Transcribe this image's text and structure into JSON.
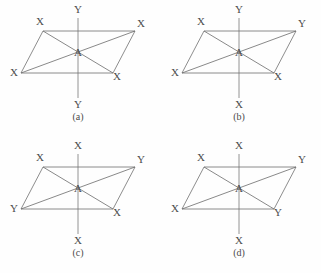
{
  "figure": {
    "background_color": "#fefefe",
    "line_color": "#6b6b6b",
    "text_color": "#4c4c4c"
  },
  "panels": [
    {
      "id": "a",
      "caption": "(a)",
      "center_label": "A",
      "labels": {
        "axial_top": "Y",
        "axial_bottom": "Y",
        "top_left": "X",
        "top_right": "X",
        "bottom_left": "X",
        "bottom_right": "X"
      }
    },
    {
      "id": "b",
      "caption": "(b)",
      "center_label": "A",
      "labels": {
        "axial_top": "Y",
        "axial_bottom": "X",
        "top_left": "X",
        "top_right": "Y",
        "bottom_left": "X",
        "bottom_right": "X"
      }
    },
    {
      "id": "c",
      "caption": "(c)",
      "center_label": "A",
      "labels": {
        "axial_top": "X",
        "axial_bottom": "X",
        "top_left": "X",
        "top_right": "Y",
        "bottom_left": "Y",
        "bottom_right": "X"
      }
    },
    {
      "id": "d",
      "caption": "(d)",
      "center_label": "A",
      "labels": {
        "axial_top": "X",
        "axial_bottom": "X",
        "top_left": "X",
        "top_right": "Y",
        "bottom_left": "X",
        "bottom_right": "Y"
      }
    }
  ]
}
